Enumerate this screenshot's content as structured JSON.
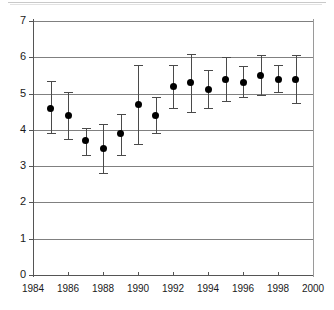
{
  "chart_data": {
    "type": "scatter",
    "title": "",
    "subtitle": "",
    "xlabel": "",
    "ylabel": "",
    "xlim": [
      1984,
      2000
    ],
    "ylim": [
      0,
      7
    ],
    "xticks": [
      1984,
      1986,
      1988,
      1990,
      1992,
      1994,
      1996,
      1998,
      2000
    ],
    "xtick_labels": [
      "1984",
      "1986",
      "1988",
      "1990",
      "1992",
      "1994",
      "1996",
      "1998",
      "2000"
    ],
    "yticks": [
      0,
      1,
      2,
      3,
      4,
      5,
      6,
      7
    ],
    "ytick_labels": [
      "0",
      "1",
      "2",
      "3",
      "4",
      "5",
      "6",
      "7"
    ],
    "grid": "horizontal",
    "legend": "none",
    "marker": "filled-diamond",
    "error_bars": "vertical",
    "x": [
      1985,
      1986,
      1987,
      1988,
      1989,
      1990,
      1991,
      1992,
      1993,
      1994,
      1995,
      1996,
      1997,
      1998,
      1999
    ],
    "values": [
      4.6,
      4.4,
      3.7,
      3.5,
      3.9,
      4.7,
      4.4,
      5.2,
      5.3,
      5.1,
      5.4,
      5.3,
      5.5,
      5.4,
      5.4
    ],
    "error_low": [
      3.9,
      3.75,
      3.3,
      2.8,
      3.3,
      3.6,
      3.9,
      4.6,
      4.5,
      4.6,
      4.8,
      4.9,
      4.95,
      5.05,
      4.75
    ],
    "error_high": [
      5.35,
      5.05,
      4.05,
      4.15,
      4.45,
      5.8,
      4.9,
      5.8,
      6.1,
      5.65,
      6.0,
      5.75,
      6.05,
      5.8,
      6.05
    ],
    "series": [
      {
        "name": "series-1",
        "points": [
          {
            "x": 1985,
            "y": 4.6,
            "low": 3.9,
            "high": 5.35
          },
          {
            "x": 1986,
            "y": 4.4,
            "low": 3.75,
            "high": 5.05
          },
          {
            "x": 1987,
            "y": 3.7,
            "low": 3.3,
            "high": 4.05
          },
          {
            "x": 1988,
            "y": 3.5,
            "low": 2.8,
            "high": 4.15
          },
          {
            "x": 1989,
            "y": 3.9,
            "low": 3.3,
            "high": 4.45
          },
          {
            "x": 1990,
            "y": 4.7,
            "low": 3.6,
            "high": 5.8
          },
          {
            "x": 1991,
            "y": 4.4,
            "low": 3.9,
            "high": 4.9
          },
          {
            "x": 1992,
            "y": 5.2,
            "low": 4.6,
            "high": 5.8
          },
          {
            "x": 1993,
            "y": 5.3,
            "low": 4.5,
            "high": 6.1
          },
          {
            "x": 1994,
            "y": 5.1,
            "low": 4.6,
            "high": 5.65
          },
          {
            "x": 1995,
            "y": 5.4,
            "low": 4.8,
            "high": 6.0
          },
          {
            "x": 1996,
            "y": 5.3,
            "low": 4.9,
            "high": 5.75
          },
          {
            "x": 1997,
            "y": 5.5,
            "low": 4.95,
            "high": 6.05
          },
          {
            "x": 1998,
            "y": 5.4,
            "low": 5.05,
            "high": 5.8
          },
          {
            "x": 1999,
            "y": 5.4,
            "low": 4.75,
            "high": 6.05
          }
        ]
      }
    ],
    "colors": {
      "marker": "#000000",
      "error_bar": "#4a4a4a",
      "gridline": "#808080",
      "axis": "#555555",
      "background": "#ffffff",
      "tick_text": "#1a1a1a"
    }
  }
}
